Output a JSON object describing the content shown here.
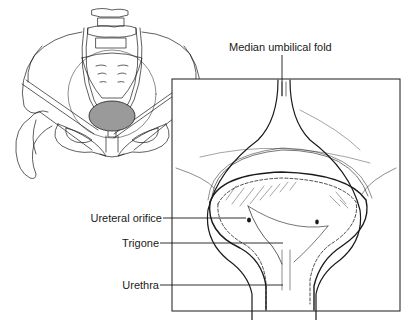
{
  "diagram": {
    "colors": {
      "line": "#1a1a1a",
      "bladder_fill": "#9a9a9a",
      "background": "#ffffff"
    },
    "labels": {
      "median_umbilical_fold": "Median umbilical fold",
      "ureteral_orifice": "Ureteral orifice",
      "trigone": "Trigone",
      "urethra": "Urethra"
    }
  }
}
